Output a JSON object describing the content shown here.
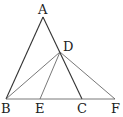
{
  "diagram": {
    "type": "geometry",
    "points": {
      "A": {
        "label": "A",
        "x": 43,
        "y": 17
      },
      "B": {
        "label": "B",
        "x": 6,
        "y": 99
      },
      "C": {
        "label": "C",
        "x": 82,
        "y": 99
      },
      "D": {
        "label": "D",
        "x": 60,
        "y": 52
      },
      "E": {
        "label": "E",
        "x": 40,
        "y": 99
      },
      "F": {
        "label": "F",
        "x": 115,
        "y": 99
      }
    },
    "segments": [
      [
        "A",
        "B"
      ],
      [
        "A",
        "C"
      ],
      [
        "B",
        "F"
      ],
      [
        "B",
        "D"
      ],
      [
        "D",
        "E"
      ],
      [
        "D",
        "F"
      ]
    ],
    "labels": {
      "A": "A",
      "B": "B",
      "C": "C",
      "D": "D",
      "E": "E",
      "F": "F"
    }
  }
}
